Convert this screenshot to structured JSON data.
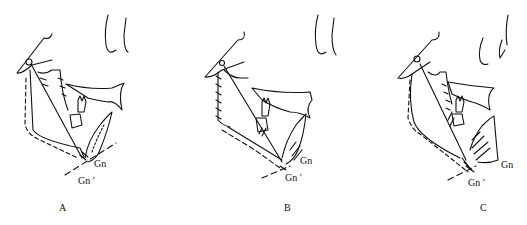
{
  "figure": {
    "panels": [
      {
        "id": "A",
        "label": "A",
        "gn": "Gn",
        "gn_prime": "Gn ′"
      },
      {
        "id": "B",
        "label": "B",
        "gn": "Gn",
        "gn_prime": "Gn ′"
      },
      {
        "id": "C",
        "label": "C",
        "gn": "Gn",
        "gn_prime": "Gn ′"
      }
    ],
    "colors": {
      "ink": "#111111",
      "background": "#ffffff"
    }
  }
}
